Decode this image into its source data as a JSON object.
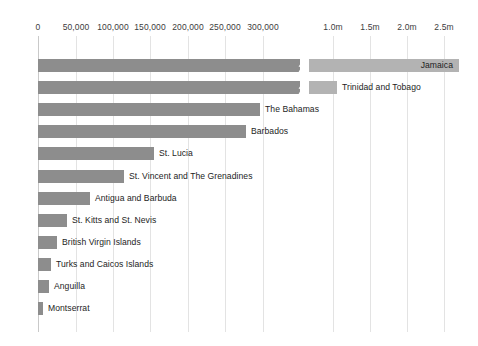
{
  "chart_data": {
    "type": "bar",
    "orientation": "horizontal",
    "title": "",
    "subtitle": "",
    "xlabel": "",
    "ylabel": "",
    "grid": true,
    "legend": null,
    "axis_break": {
      "present": true,
      "after_value": 320000,
      "resume_value": 850000,
      "note": "x-axis is broken between ~320,000 and ~850,000"
    },
    "xlim": [
      0,
      2600000
    ],
    "tick_labels": [
      "0",
      "50,000",
      "100,000",
      "150,000",
      "200,000",
      "250,000",
      "300,000",
      "1.0m",
      "1.5m",
      "2.0m",
      "2.5m"
    ],
    "tick_values": [
      0,
      50000,
      100000,
      150000,
      200000,
      250000,
      300000,
      1000000,
      1500000,
      2000000,
      2500000
    ],
    "categories": [
      "Jamaica",
      "Trinidad and Tobago",
      "The Bahamas",
      "Barbados",
      "St. Lucia",
      "St. Vincent and The Grenadines",
      "Antigua and Barbuda",
      "St. Kitts and St. Nevis",
      "British Virgin Islands",
      "Turks and Caicos Islands",
      "Anguilla",
      "Montserrat"
    ],
    "values": [
      2750000,
      1360000,
      297000,
      277000,
      158000,
      118000,
      70000,
      39000,
      25000,
      18000,
      15000,
      5000
    ],
    "bars": [
      {
        "label": "Jamaica",
        "value": 2750000,
        "pixel_end": 459,
        "broken": true,
        "label_position": "inside-right"
      },
      {
        "label": "Trinidad and Tobago",
        "value": 1360000,
        "pixel_end": 337,
        "broken": true,
        "label_position": "outside"
      },
      {
        "label": "The Bahamas",
        "value": 297000,
        "pixel_end": 260,
        "broken": false,
        "label_position": "outside"
      },
      {
        "label": "Barbados",
        "value": 277000,
        "pixel_end": 246,
        "broken": false,
        "label_position": "outside"
      },
      {
        "label": "St. Lucia",
        "value": 158000,
        "pixel_end": 154,
        "broken": false,
        "label_position": "outside"
      },
      {
        "label": "St. Vincent and The Grenadines",
        "value": 118000,
        "pixel_end": 124,
        "broken": false,
        "label_position": "outside"
      },
      {
        "label": "Antigua and Barbuda",
        "value": 70000,
        "pixel_end": 90,
        "broken": false,
        "label_position": "outside"
      },
      {
        "label": "St. Kitts and St. Nevis",
        "value": 39000,
        "pixel_end": 67,
        "broken": false,
        "label_position": "outside"
      },
      {
        "label": "British Virgin Islands",
        "value": 25000,
        "pixel_end": 57,
        "broken": false,
        "label_position": "outside"
      },
      {
        "label": "Turks and Caicos Islands",
        "value": 18000,
        "pixel_end": 51,
        "broken": false,
        "label_position": "outside"
      },
      {
        "label": "Anguilla",
        "value": 15000,
        "pixel_end": 49,
        "broken": false,
        "label_position": "outside"
      },
      {
        "label": "Montserrat",
        "value": 5000,
        "pixel_end": 43,
        "broken": false,
        "label_position": "outside"
      }
    ],
    "colors": {
      "bar_primary": "#8d8d8d",
      "bar_secondary": "#b3b3b3",
      "gridline": "#e3e3e3",
      "axis": "#c9c9c9",
      "label_text": "#1d1d1d",
      "tick_text": "#3c3c3c",
      "background": "#ffffff"
    }
  }
}
